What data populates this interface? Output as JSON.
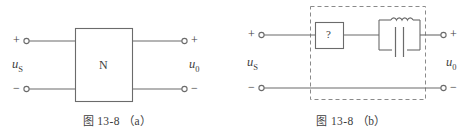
{
  "figure": {
    "id": "13-8",
    "panels": [
      {
        "key": "a",
        "caption_cjk": "图",
        "caption_number": "13-8",
        "caption_part": "（a）",
        "block_label": "N",
        "source_label": "u",
        "source_sub": "S",
        "output_label": "u",
        "output_sub": "0",
        "input_plus": "+",
        "input_minus": "−",
        "output_plus": "+",
        "output_minus": "−"
      },
      {
        "key": "b",
        "caption_cjk": "图",
        "caption_number": "13-8",
        "caption_part": "（b）",
        "unknown_block_label": "?",
        "source_label": "u",
        "source_sub": "S",
        "output_label": "u",
        "output_sub": "0",
        "input_plus": "+",
        "input_minus": "−",
        "output_plus": "+",
        "output_minus": "−"
      }
    ]
  },
  "style": {
    "line_color": "#6b6b6b",
    "text_color": "#3d3d3d",
    "dash_color": "#8a8a8a",
    "background": "#ffffff"
  }
}
